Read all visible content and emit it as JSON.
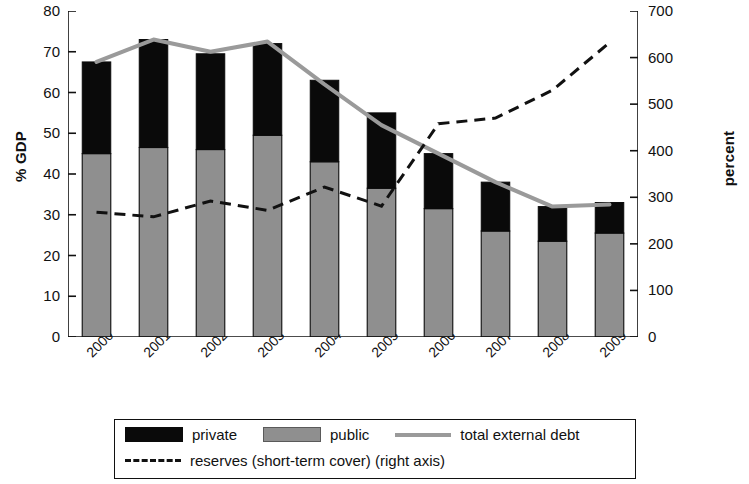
{
  "chart_data": {
    "type": "bar",
    "title": "",
    "subtitle": "",
    "xlabel": "",
    "ylabel": "% GDP",
    "ylabel_right": "percent",
    "categories": [
      "2000",
      "2001",
      "2002",
      "2003",
      "2004",
      "2005",
      "2006",
      "2007",
      "2008",
      "2009"
    ],
    "ylim": [
      0,
      80
    ],
    "ylim_right": [
      0,
      700
    ],
    "yticks": [
      0,
      10,
      20,
      30,
      40,
      50,
      60,
      70,
      80
    ],
    "yticks_right": [
      0,
      100,
      200,
      300,
      400,
      500,
      600,
      700
    ],
    "grid": false,
    "legend_position": "bottom",
    "stacked": true,
    "series": [
      {
        "name": "public",
        "type": "bar-segment",
        "axis": "left",
        "color": "#8f8f8f",
        "values": [
          45,
          46.5,
          46,
          49.5,
          43,
          36.5,
          31.5,
          26,
          23.5,
          25.5
        ]
      },
      {
        "name": "private",
        "type": "bar-segment",
        "axis": "left",
        "color": "#0a0a0a",
        "values": [
          22.5,
          26.5,
          23.5,
          22.5,
          20,
          18.5,
          13.5,
          12,
          8.5,
          7.5
        ]
      },
      {
        "name": "total external debt",
        "type": "line",
        "axis": "left",
        "color": "#9a9a9a",
        "values": [
          67.5,
          73,
          70,
          72.5,
          62,
          52,
          45,
          38,
          32,
          32.5
        ]
      },
      {
        "name": "reserves (short-term cover) (right axis)",
        "type": "line-dashed",
        "axis": "right",
        "color": "#111111",
        "values": [
          268,
          258,
          292,
          272,
          322,
          281,
          458,
          470,
          530,
          632
        ]
      }
    ]
  },
  "axes": {
    "left": {
      "label": "% GDP",
      "ticks": [
        "80",
        "70",
        "60",
        "50",
        "40",
        "30",
        "20",
        "10",
        "0"
      ]
    },
    "right": {
      "label": "percent",
      "ticks": [
        "700",
        "600",
        "500",
        "400",
        "300",
        "200",
        "100",
        "0"
      ]
    },
    "x": {
      "ticks": [
        "2000",
        "2001",
        "2002",
        "2003",
        "2004",
        "2005",
        "2006",
        "2007",
        "2008",
        "2009"
      ]
    }
  },
  "legend": {
    "items": [
      {
        "label": "private",
        "marker": "black-swatch"
      },
      {
        "label": "public",
        "marker": "gray-swatch"
      },
      {
        "label": "total external debt",
        "marker": "solid-gray-line"
      },
      {
        "label": "reserves (short-term cover) (right axis)",
        "marker": "black-dashed-line"
      }
    ]
  }
}
